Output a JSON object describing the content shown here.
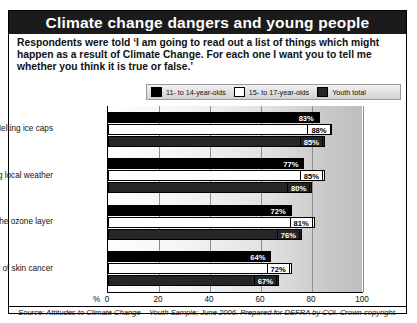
{
  "title": "Climate change dangers and young people",
  "intro": "Respondents were told ‘I am going to read out a list of things which might happen as a result of Climate Change. For each one I want you to tell me whether you think it is true or false.’",
  "legend": {
    "items": [
      {
        "label": "11- to 14-year-olds",
        "color": "#000000"
      },
      {
        "label": "15- to 17-year-olds",
        "color": "#ffffff"
      },
      {
        "label": "Youth total",
        "color": "#262626"
      }
    ]
  },
  "axis_unit": "%",
  "source": "Source: Attitudes to Climate Change – Youth Sample; June 2006. Prepared for DEFRA by COI. Crown copyright.",
  "chart_data": {
    "type": "bar",
    "orientation": "horizontal",
    "title": "Climate change dangers and young people",
    "xlabel": "%",
    "ylabel": "",
    "xlim": [
      0,
      100
    ],
    "grid": true,
    "legend_position": "top",
    "xticks": [
      "0",
      "20",
      "40",
      "60",
      "80",
      "100"
    ],
    "xtick_values": [
      0,
      20,
      40,
      60,
      80,
      100
    ],
    "categories": [
      "Melting ice caps",
      "Changing local weather",
      "A hole in the ozone layer",
      "Increased risk of skin cancer"
    ],
    "series": [
      {
        "name": "11- to 14-year-olds",
        "color": "#000000",
        "values": [
          83,
          77,
          72,
          64
        ],
        "labels": [
          "83%",
          "77%",
          "72%",
          "64%"
        ]
      },
      {
        "name": "15- to 17-year-olds",
        "color": "#ffffff",
        "values": [
          88,
          85,
          81,
          72
        ],
        "labels": [
          "88%",
          "85%",
          "81%",
          "72%"
        ]
      },
      {
        "name": "Youth total",
        "color": "#262626",
        "values": [
          85,
          80,
          76,
          67
        ],
        "labels": [
          "85%",
          "80%",
          "76%",
          "67%"
        ]
      }
    ]
  }
}
